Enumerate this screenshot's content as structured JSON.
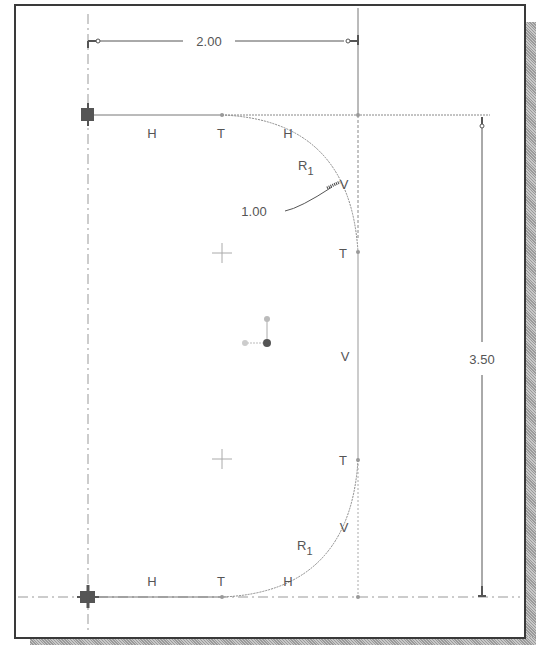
{
  "figure": {
    "type": "cad-sketch"
  },
  "dimensions": {
    "width_label": "2.00",
    "height_label": "3.50",
    "radius_label": "1.00"
  },
  "constraints": {
    "top_h_left": "H",
    "top_t": "T",
    "top_h_right": "H",
    "top_radius": "R",
    "top_radius_sub": "1",
    "top_v": "V",
    "upper_t_right": "T",
    "middle_v": "V",
    "lower_t_right": "T",
    "bottom_v": "V",
    "bottom_radius": "R",
    "bottom_radius_sub": "1",
    "bottom_h_left": "H",
    "bottom_t": "T",
    "bottom_h_right": "H"
  },
  "colors": {
    "frame": "#3a3a3a",
    "line": "#707070",
    "faint": "#b0b0b0",
    "text": "#555555"
  }
}
